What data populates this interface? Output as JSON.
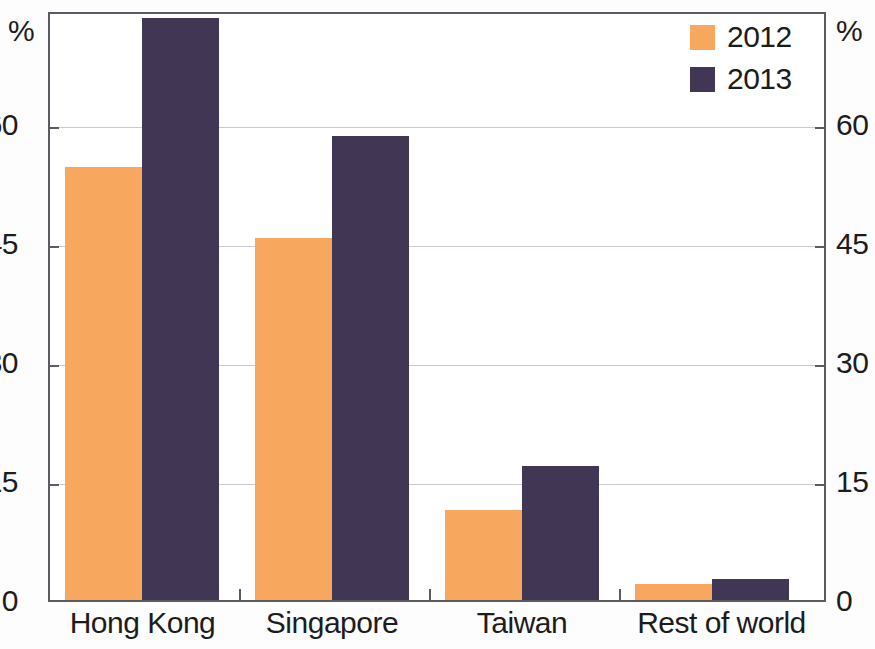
{
  "axes": {
    "unit_left": "%",
    "unit_right": "%",
    "yticks": [
      "60",
      "45",
      "30",
      "15",
      "0"
    ],
    "ytick_values": [
      60,
      45,
      30,
      15,
      0
    ]
  },
  "legend": {
    "position": "top-right",
    "entries": [
      {
        "label": "2012",
        "color": "#f7a85e"
      },
      {
        "label": "2013",
        "color": "#413653"
      }
    ]
  },
  "chart_data": {
    "type": "bar",
    "title": "",
    "subtitle": "",
    "xlabel": "",
    "ylabel": "%",
    "ylim": [
      0,
      75
    ],
    "ytick_step": 15,
    "grid": true,
    "categories": [
      "Hong Kong",
      "Singapore",
      "Taiwan",
      "Rest of world"
    ],
    "series": [
      {
        "name": "2012",
        "color": "#f7a85e",
        "values": [
          55,
          46,
          11.5,
          2
        ]
      },
      {
        "name": "2013",
        "color": "#413653",
        "values": [
          74,
          59,
          17,
          2.7
        ]
      }
    ],
    "annotations": [],
    "legend_position": "top-right",
    "right_axis_mirrors_left": true
  }
}
